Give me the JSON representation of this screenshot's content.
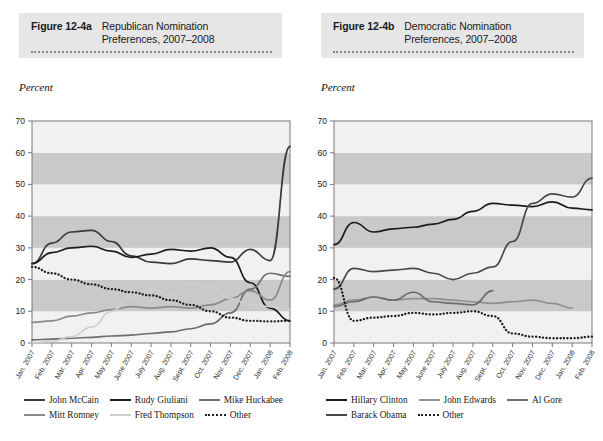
{
  "figures": [
    {
      "id": "12-4a",
      "number_label": "Figure 12-4a",
      "title_line1": "Republican Nomination",
      "title_line2": "Preferences, 2007–2008",
      "y_axis_label": "Percent"
    },
    {
      "id": "12-4b",
      "number_label": "Figure 12-4b",
      "title_line1": "Democratic Nomination",
      "title_line2": "Preferences, 2007–2008",
      "y_axis_label": "Percent"
    }
  ],
  "chart_data": [
    {
      "type": "line",
      "title": "Republican Nomination Preferences, 2007–2008",
      "xlabel": "",
      "ylabel": "Percent",
      "ylim": [
        0,
        70
      ],
      "yticks": [
        0,
        10,
        20,
        30,
        40,
        50,
        60,
        70
      ],
      "grid": "horizontal-bands",
      "legend_position": "bottom",
      "x": [
        "Jan. 2007",
        "Feb. 2007",
        "Mar. 2007",
        "Apr. 2007",
        "May 2007",
        "June 2007",
        "July 2007",
        "Aug. 2007",
        "Sept. 2007",
        "Oct. 2007",
        "Nov. 2007",
        "Dec. 2007",
        "Jan. 2008",
        "Feb. 2008"
      ],
      "series": [
        {
          "name": "John McCain",
          "color": "#3a3a3a",
          "style": "solid",
          "values": [
            25.0,
            31.5,
            35.0,
            35.5,
            32.0,
            27.5,
            25.5,
            25.0,
            26.5,
            26.0,
            25.5,
            29.5,
            26.0,
            62.0
          ]
        },
        {
          "name": "Rudy Giuliani",
          "color": "#1c1c1c",
          "style": "solid",
          "values": [
            25.0,
            28.5,
            30.0,
            30.5,
            29.0,
            27.0,
            28.0,
            29.5,
            29.0,
            30.0,
            27.0,
            19.0,
            11.0,
            7.0
          ]
        },
        {
          "name": "Mike Huckabee",
          "color": "#6e6e6e",
          "style": "solid",
          "values": [
            1.0,
            1.2,
            1.5,
            1.8,
            2.2,
            2.5,
            3.0,
            3.5,
            4.5,
            6.0,
            9.5,
            17.0,
            22.0,
            21.0
          ]
        },
        {
          "name": "Mitt Romney",
          "color": "#8a8a8a",
          "style": "solid",
          "values": [
            6.5,
            7.0,
            8.5,
            9.5,
            10.5,
            11.5,
            11.0,
            11.5,
            11.0,
            12.0,
            14.0,
            16.5,
            13.5,
            22.5
          ]
        },
        {
          "name": "Fred Thompson",
          "color": "#cfcfcf",
          "style": "solid",
          "values": [
            0.0,
            0.5,
            2.0,
            5.0,
            10.0,
            14.5,
            17.0,
            15.0,
            19.0,
            17.5,
            14.0,
            12.0,
            11.5,
            10.5
          ]
        },
        {
          "name": "Other",
          "color": "#1c1c1c",
          "style": "dotted",
          "values": [
            24.0,
            22.0,
            20.0,
            18.5,
            17.0,
            16.0,
            15.0,
            13.5,
            12.0,
            10.0,
            8.0,
            7.0,
            6.8,
            7.0
          ]
        }
      ]
    },
    {
      "type": "line",
      "title": "Democratic Nomination Preferences, 2007–2008",
      "xlabel": "",
      "ylabel": "Percent",
      "ylim": [
        0,
        70
      ],
      "yticks": [
        0,
        10,
        20,
        30,
        40,
        50,
        60,
        70
      ],
      "grid": "horizontal-bands",
      "legend_position": "bottom",
      "x": [
        "Jan. 2007",
        "Feb. 2007",
        "Mar. 2007",
        "Apr. 2007",
        "May 2007",
        "June 2007",
        "July 2007",
        "Aug. 2007",
        "Sept. 2007",
        "Oct. 2007",
        "Nov. 2007",
        "Dec. 2007",
        "Jan. 2008",
        "Feb. 2008"
      ],
      "series": [
        {
          "name": "Hillary Clinton",
          "color": "#1c1c1c",
          "style": "solid",
          "values": [
            31.0,
            38.0,
            35.0,
            36.0,
            36.5,
            37.5,
            39.0,
            41.5,
            44.0,
            43.5,
            43.0,
            44.5,
            42.5,
            42.0
          ]
        },
        {
          "name": "John Edwards",
          "color": "#8f8f8f",
          "style": "solid",
          "values": [
            12.0,
            13.5,
            14.5,
            13.5,
            14.0,
            14.0,
            13.5,
            13.0,
            12.5,
            13.0,
            13.5,
            12.5,
            11.0,
            null
          ]
        },
        {
          "name": "Al Gore",
          "color": "#6e6e6e",
          "style": "solid",
          "values": [
            11.5,
            13.0,
            14.5,
            13.5,
            16.0,
            13.0,
            12.5,
            12.0,
            16.5,
            null,
            null,
            null,
            null,
            null
          ]
        },
        {
          "name": "Barack Obama",
          "color": "#4a4a4a",
          "style": "solid",
          "values": [
            17.0,
            23.5,
            22.5,
            23.0,
            23.5,
            22.0,
            20.0,
            22.0,
            24.0,
            32.0,
            44.0,
            47.0,
            46.0,
            52.0
          ]
        },
        {
          "name": "Other",
          "color": "#1c1c1c",
          "style": "dotted",
          "values": [
            20.5,
            7.0,
            8.0,
            8.5,
            9.5,
            9.0,
            9.5,
            10.0,
            8.5,
            3.0,
            2.0,
            1.5,
            1.5,
            2.0
          ]
        }
      ]
    }
  ],
  "legends": [
    {
      "rows": [
        [
          {
            "label": "John McCain",
            "color": "#3a3a3a",
            "style": "solid"
          },
          {
            "label": "Rudy Giuliani",
            "color": "#1c1c1c",
            "style": "solid"
          },
          {
            "label": "Mike Huckabee",
            "color": "#6e6e6e",
            "style": "solid"
          }
        ],
        [
          {
            "label": "Mitt Romney",
            "color": "#8a8a8a",
            "style": "solid"
          },
          {
            "label": "Fred Thompson",
            "color": "#cfcfcf",
            "style": "solid"
          },
          {
            "label": "Other",
            "color": "#1c1c1c",
            "style": "dotted"
          }
        ]
      ]
    },
    {
      "rows": [
        [
          {
            "label": "Hillary Clinton",
            "color": "#1c1c1c",
            "style": "solid"
          },
          {
            "label": "John Edwards",
            "color": "#8f8f8f",
            "style": "solid"
          },
          {
            "label": "Al Gore",
            "color": "#6e6e6e",
            "style": "solid"
          }
        ],
        [
          {
            "label": "Barack Obama",
            "color": "#4a4a4a",
            "style": "solid"
          },
          {
            "label": "Other",
            "color": "#1c1c1c",
            "style": "dotted"
          }
        ]
      ]
    }
  ],
  "style": {
    "band_light": "#f1f1f1",
    "band_dark": "#c9c9c9",
    "header_bg": "#e6e6e6",
    "axis_color": "#7a7a7a"
  }
}
